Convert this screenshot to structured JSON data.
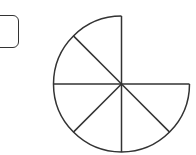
{
  "answer_box": {
    "value": ""
  },
  "figure": {
    "shape": "three-quarter circle divided into equal sectors",
    "center": [
      121.5,
      84
    ],
    "radius": 68,
    "missing_quadrant": "top-right",
    "sector_angle_deg": 45,
    "sector_count": 6,
    "stroke_color": "#333333",
    "fill_color": "#ffffff"
  }
}
